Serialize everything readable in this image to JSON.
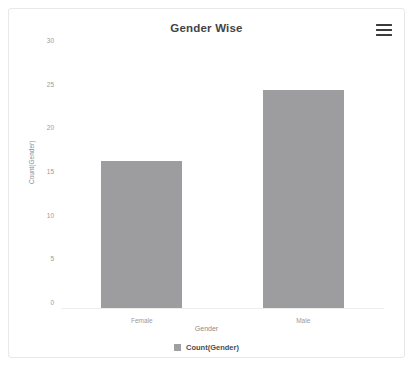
{
  "card": {
    "title": "Gender Wise",
    "menu_icon": "hamburger-menu-icon"
  },
  "chart_data": {
    "type": "bar",
    "title": "Gender Wise",
    "categories": [
      "Female",
      "Male"
    ],
    "values": [
      17.0,
      25.1
    ],
    "series": [
      {
        "name": "Count(Gender)",
        "values": [
          17.0,
          25.1
        ]
      }
    ],
    "xlabel": "Gender",
    "ylabel": "Count(Gender)",
    "ylim": [
      0,
      30
    ],
    "yticks": [
      0,
      5,
      10,
      15,
      20,
      25,
      30
    ],
    "ytick_labels": [
      "0",
      "5",
      "10",
      "15",
      "20",
      "25",
      "30"
    ],
    "grid": false,
    "legend": {
      "position": "bottom",
      "entries": [
        {
          "label": "Count(Gender)",
          "color": "#a0a0a2"
        }
      ]
    },
    "bar_color": "#9d9d9f"
  }
}
